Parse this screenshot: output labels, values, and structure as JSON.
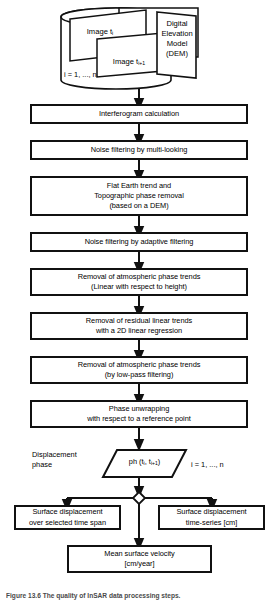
{
  "figure": {
    "type": "flowchart",
    "caption": "Figure 13.6 The quality of InSAR data processing steps.",
    "colors": {
      "stroke": "#111111",
      "fill": "#ffffff",
      "caption": "#4a4a4a"
    }
  },
  "datastore": {
    "name": "input-data-cylinder",
    "items": [
      {
        "label": "Image t",
        "sub": "i"
      },
      {
        "label": "Image t",
        "sub": "i+1"
      }
    ],
    "dem_label": "Digital\nElevation\nModel\n(DEM)",
    "index_note": "i = 1, ..., n"
  },
  "steps": [
    {
      "id": "interferogram",
      "text": "Interferogram calculation"
    },
    {
      "id": "multilook",
      "text": "Noise filtering by multi-looking"
    },
    {
      "id": "flat-earth",
      "text": "Flat Earth trend and\nTopographic phase removal\n(based on a DEM)"
    },
    {
      "id": "adaptive-filter",
      "text": "Noise filtering by adaptive filtering"
    },
    {
      "id": "atmo-height",
      "text": "Removal of atmospheric phase trends\n(Linear with respect to height)"
    },
    {
      "id": "residual-2d",
      "text": "Removal of residual linear trends\nwith a 2D linear regression"
    },
    {
      "id": "atmo-lowpass",
      "text": "Removal of atmospheric phase trends\n(by low-pass filtering)"
    },
    {
      "id": "unwrap",
      "text": "Phase unwrapping\nwith respect to a reference point"
    }
  ],
  "displacement": {
    "side_label": "Displacement\nphase",
    "parallelogram": {
      "prefix": "ph (t",
      "sub1": "i",
      "mid": ", t",
      "sub2": "i+1",
      "suffix": ")"
    },
    "index_note": "i = 1, ..., n"
  },
  "outputs": [
    {
      "id": "time-span",
      "text": "Surface displacement\nover selected time span"
    },
    {
      "id": "time-series",
      "text": "Surface displacement\ntime-series [cm]"
    }
  ],
  "final": {
    "id": "mean-velocity",
    "text": "Mean surface velocity\n[cm/year]"
  }
}
